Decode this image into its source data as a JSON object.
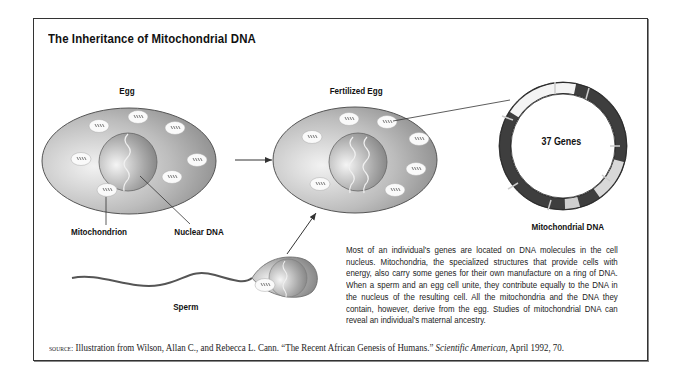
{
  "title": "The Inheritance of Mitochondrial DNA",
  "labels": {
    "egg": "Egg",
    "fertilized_egg": "Fertilized Egg",
    "mitochondrion": "Mitochondrion",
    "nuclear_dna": "Nuclear DNA",
    "sperm": "Sperm",
    "mitochondrial_dna": "Mitochondrial DNA",
    "genes": "37 Genes"
  },
  "description": "Most of an individual's genes are located on DNA molecules in the cell nucleus. Mitochondria, the specialized structures that provide cells with energy, also carry some genes for their own manufacture on a ring of DNA. When a sperm and an egg cell unite, they contribute equally to the DNA in the nucleus of the resulting cell. All the mitochondria and the DNA they contain, however, derive from the egg. Studies of mitochondrial DNA can reveal an individual's maternal ancestry.",
  "source": {
    "prefix": "source:",
    "text": " Illustration from Wilson, Allan C., and Rebecca L. Cann. “The Recent African Genesis of Humans.” ",
    "journal": "Scientific American,",
    "suffix": " April 1992, 70."
  },
  "colors": {
    "cell_light": "#e6e6e6",
    "cell_dark": "#8c8c8c",
    "ring_dark": "#3a3a3a",
    "ring_light": "#f2f2f2",
    "frame": "#333333"
  }
}
